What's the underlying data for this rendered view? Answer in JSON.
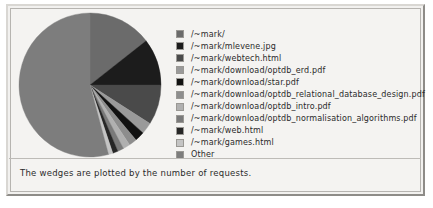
{
  "caption": "The wedges are plotted by the number of requests.",
  "legend": {
    "entries": [
      {
        "label": "/~mark/",
        "color": "#6b6b6b"
      },
      {
        "label": "/~mark/mlevene.jpg",
        "color": "#1c1c1c"
      },
      {
        "label": "/~mark/webtech.html",
        "color": "#4a4a4a"
      },
      {
        "label": "/~mark/download/optdb_erd.pdf",
        "color": "#9a9a9a"
      },
      {
        "label": "/~mark/download/star.pdf",
        "color": "#111111"
      },
      {
        "label": "/~mark/download/optdb_relational_database_design.pdf",
        "color": "#8d8d8d"
      },
      {
        "label": "/~mark/download/optdb_intro.pdf",
        "color": "#b0b0b0"
      },
      {
        "label": "/~mark/download/optdb_normalisation_algorithms.pdf",
        "color": "#7a7a7a"
      },
      {
        "label": "/~mark/web.html",
        "color": "#262626"
      },
      {
        "label": "/~mark/games.html",
        "color": "#c4c4c4"
      },
      {
        "label": "Other",
        "color": "#7d7d7d"
      }
    ]
  },
  "chart_data": {
    "type": "pie",
    "title": "",
    "value_label": "number of requests",
    "legend_position": "right",
    "start_angle_deg": -90,
    "direction": "clockwise",
    "labels": [
      "/~mark/",
      "/~mark/mlevene.jpg",
      "/~mark/webtech.html",
      "/~mark/download/optdb_erd.pdf",
      "/~mark/download/star.pdf",
      "/~mark/download/optdb_relational_database_design.pdf",
      "/~mark/download/optdb_intro.pdf",
      "/~mark/download/optdb_normalisation_algorithms.pdf",
      "/~mark/web.html",
      "/~mark/games.html",
      "Other"
    ],
    "values": [
      14.5,
      10.5,
      9.0,
      2.6,
      2.2,
      1.8,
      1.6,
      1.4,
      1.2,
      1.0,
      54.2
    ],
    "unit": "percent",
    "colors": [
      "#6b6b6b",
      "#1c1c1c",
      "#4a4a4a",
      "#9a9a9a",
      "#111111",
      "#8d8d8d",
      "#b0b0b0",
      "#7a7a7a",
      "#262626",
      "#c4c4c4",
      "#7d7d7d"
    ]
  }
}
